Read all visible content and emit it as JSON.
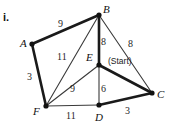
{
  "figure": {
    "item_number": "i.",
    "note_label": "(Start)",
    "ink_color": "#1a1a1a",
    "background_color": "#ffffff"
  },
  "chart_data": {
    "type": "diagram",
    "title": "",
    "nodes": [
      {
        "id": "A",
        "label": "A",
        "x": 32,
        "y": 44,
        "label_x": 20,
        "label_y": 38
      },
      {
        "id": "B",
        "label": "B",
        "x": 99,
        "y": 15,
        "label_x": 103,
        "label_y": 4
      },
      {
        "id": "C",
        "label": "C",
        "x": 152,
        "y": 93,
        "label_x": 157,
        "label_y": 89
      },
      {
        "id": "D",
        "label": "D",
        "x": 99,
        "y": 105,
        "label_x": 95,
        "label_y": 112
      },
      {
        "id": "E",
        "label": "E",
        "x": 99,
        "y": 65,
        "label_x": 86,
        "label_y": 52
      },
      {
        "id": "F",
        "label": "F",
        "x": 46,
        "y": 106,
        "label_x": 33,
        "label_y": 106
      }
    ],
    "edges": [
      {
        "from": "A",
        "to": "B",
        "weight": "9",
        "style": "thick",
        "label_x": 58,
        "label_y": 19
      },
      {
        "from": "A",
        "to": "F",
        "weight": "3",
        "style": "thick",
        "label_x": 27,
        "label_y": 72
      },
      {
        "from": "B",
        "to": "E",
        "weight": "8",
        "style": "thick",
        "label_x": 101,
        "label_y": 37
      },
      {
        "from": "B",
        "to": "C",
        "weight": "8",
        "style": "thin",
        "label_x": 128,
        "label_y": 39
      },
      {
        "from": "B",
        "to": "F",
        "weight": "11",
        "style": "thin",
        "label_x": 57,
        "label_y": 52
      },
      {
        "from": "E",
        "to": "F",
        "weight": "9",
        "style": "thin",
        "label_x": 70,
        "label_y": 84
      },
      {
        "from": "E",
        "to": "D",
        "weight": "6",
        "style": "thin",
        "label_x": 101,
        "label_y": 84
      },
      {
        "from": "E",
        "to": "C",
        "weight": "",
        "style": "thick",
        "label_x": 0,
        "label_y": 0
      },
      {
        "from": "F",
        "to": "D",
        "weight": "11",
        "style": "thin",
        "label_x": 66,
        "label_y": 111
      },
      {
        "from": "D",
        "to": "C",
        "weight": "3",
        "style": "thick",
        "label_x": 125,
        "label_y": 106
      }
    ],
    "start_node": "E",
    "weights": [
      9,
      3,
      8,
      8,
      11,
      9,
      6,
      11,
      3
    ]
  }
}
